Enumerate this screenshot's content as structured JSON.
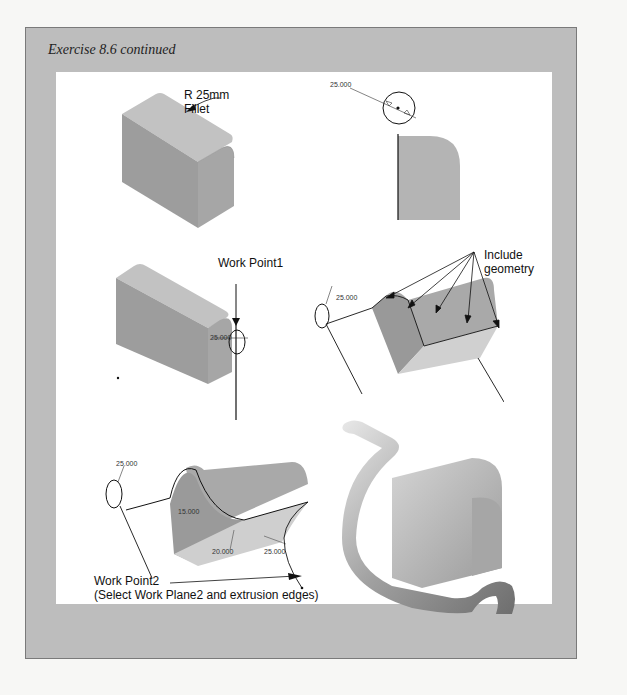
{
  "header": {
    "page_number": "",
    "exercise_title": "Exercise 8.6 continued"
  },
  "figures": {
    "fillet_block": {
      "callout_line1": "R 25mm",
      "callout_line2": "Fillet"
    },
    "sketch_profile": {
      "dimension": "25.000"
    },
    "work_point1": {
      "callout": "Work Point1",
      "dimension": "25.000"
    },
    "include_geometry": {
      "callout_line1": "Include",
      "callout_line2": "geometry",
      "dimension": "25.000"
    },
    "sweep_path": {
      "dimensions": [
        "25.000",
        "15.000",
        "20.000",
        "25.000"
      ],
      "callout_line1": "Work Point2",
      "callout_line2": "(Select Work Plane2 and extrusion edges)"
    },
    "final_part": {}
  },
  "colors": {
    "frame_background": "#bdbdbd",
    "panel_background": "#ffffff",
    "solid_face_dark": "#9a9a9a",
    "solid_face_mid": "#a8a8a8",
    "solid_face_light": "#c6c6c6",
    "line": "#111111"
  }
}
